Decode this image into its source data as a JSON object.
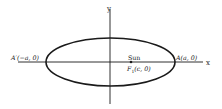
{
  "diagram": {
    "type": "ellipse-orbit",
    "axes": {
      "x_label": "x",
      "y_label": "y"
    },
    "points": {
      "left_vertex": {
        "label": "A′(−a, 0)"
      },
      "right_vertex": {
        "label": "A(a, 0)"
      },
      "focus": {
        "name_label": "Sun",
        "coord_prefix": "F",
        "coord_sub": "1",
        "coord_suffix": "(c, 0)"
      }
    },
    "colors": {
      "stroke": "#1a1a1a",
      "background": "#ffffff"
    }
  }
}
